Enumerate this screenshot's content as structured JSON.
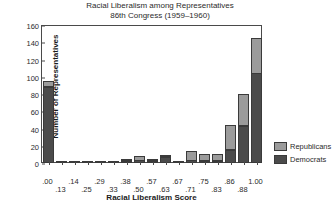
{
  "chart_data": {
    "type": "bar",
    "title": "Racial Liberalism among Representatives",
    "subtitle": "86th Congress (1959–1960)",
    "xlabel": "Racial Liberalism Score",
    "ylabel": "Number of Representatives",
    "ylim": [
      0,
      160
    ],
    "yticks": [
      0,
      20,
      40,
      60,
      80,
      100,
      120,
      140,
      160
    ],
    "grid": false,
    "stacked": true,
    "legend_position": "right-bottom",
    "categories": [
      ".00",
      ".13",
      ".14",
      ".25",
      ".29",
      ".33",
      ".38",
      ".50",
      ".57",
      ".63",
      ".67",
      ".71",
      ".75",
      ".83",
      ".86",
      ".88",
      "1.00"
    ],
    "series": [
      {
        "name": "Democrats",
        "color": "#4b4b4b",
        "values": [
          88,
          1,
          1,
          2,
          1,
          1,
          2,
          3,
          2,
          7,
          1,
          3,
          2,
          2,
          15,
          43,
          104
        ]
      },
      {
        "name": "Republicans",
        "color": "#9b9b9b",
        "values": [
          7,
          0,
          0,
          0,
          0,
          0,
          2,
          5,
          1,
          1,
          0,
          11,
          8,
          8,
          29,
          37,
          41
        ]
      }
    ],
    "totals": [
      95,
      1,
      1,
      2,
      1,
      1,
      4,
      8,
      3,
      8,
      1,
      14,
      10,
      10,
      44,
      80,
      145
    ],
    "xtick_rows": {
      "upper": [
        ".00",
        ".14",
        ".29",
        ".38",
        ".57",
        ".67",
        ".75",
        ".86",
        "1.00"
      ],
      "lower": [
        ".13",
        ".25",
        ".33",
        ".50",
        ".63",
        ".71",
        ".83",
        ".88"
      ]
    }
  },
  "legend": {
    "items": [
      {
        "label": "Republicans",
        "color": "#9b9b9b"
      },
      {
        "label": "Democrats",
        "color": "#4b4b4b"
      }
    ]
  }
}
